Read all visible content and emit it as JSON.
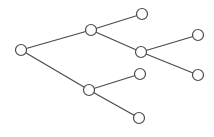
{
  "diagram": {
    "type": "tree",
    "style": {
      "stroke": "#4a4a4a",
      "node_fill": "#ffffff",
      "node_radius": 5.5,
      "stroke_width": 1.2
    },
    "nodes": [
      {
        "id": "root",
        "x": 21,
        "y": 50
      },
      {
        "id": "a",
        "x": 91,
        "y": 30
      },
      {
        "id": "b",
        "x": 89,
        "y": 90
      },
      {
        "id": "a1",
        "x": 142,
        "y": 14
      },
      {
        "id": "a2",
        "x": 141,
        "y": 52
      },
      {
        "id": "a2a",
        "x": 198,
        "y": 35
      },
      {
        "id": "a2b",
        "x": 198,
        "y": 75
      },
      {
        "id": "b1",
        "x": 140,
        "y": 74
      },
      {
        "id": "b2",
        "x": 139,
        "y": 118
      }
    ],
    "edges": [
      [
        "root",
        "a"
      ],
      [
        "root",
        "b"
      ],
      [
        "a",
        "a1"
      ],
      [
        "a",
        "a2"
      ],
      [
        "a2",
        "a2a"
      ],
      [
        "a2",
        "a2b"
      ],
      [
        "b",
        "b1"
      ],
      [
        "b",
        "b2"
      ]
    ]
  }
}
